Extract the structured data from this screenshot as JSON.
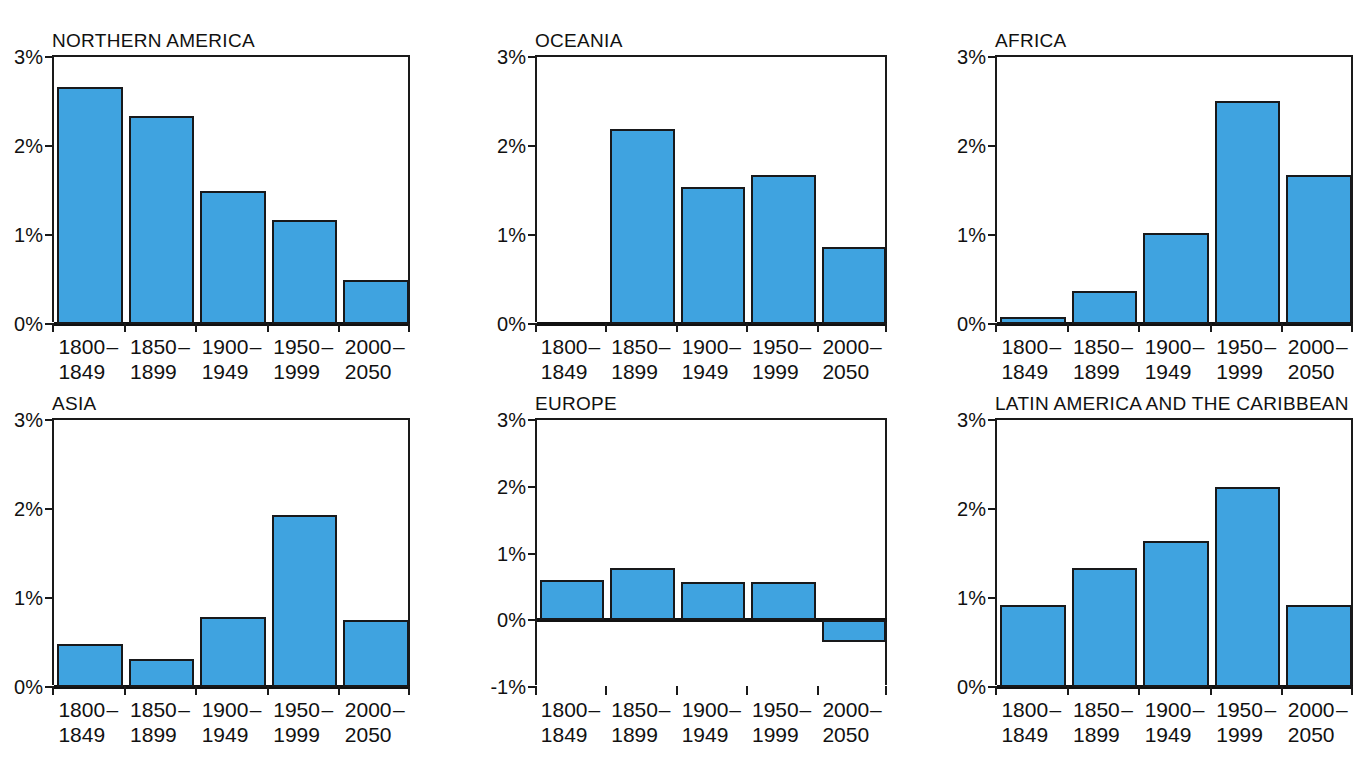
{
  "figure": {
    "clipped_caption": "",
    "bar_color": "#3fa3e0",
    "bar_stroke": "#18191b",
    "axis_color": "#1a1a1a",
    "categories": [
      {
        "line1": "1800",
        "line2": "1849",
        "dash": "–"
      },
      {
        "line1": "1850",
        "line2": "1899",
        "dash": "–"
      },
      {
        "line1": "1900",
        "line2": "1949",
        "dash": "–"
      },
      {
        "line1": "1950",
        "line2": "1999",
        "dash": "–"
      },
      {
        "line1": "2000",
        "line2": "2050",
        "dash": "–"
      }
    ]
  },
  "chart_data": [
    {
      "type": "bar",
      "title": "NORTHERN AMERICA",
      "xlabel": "",
      "ylabel": "",
      "ylim": [
        0,
        3
      ],
      "yticks": [
        0,
        1,
        2,
        3
      ],
      "ytick_labels": [
        "0%",
        "1%",
        "2%",
        "3%"
      ],
      "grid": false,
      "categories": [
        "1800 – 1849",
        "1850 – 1899",
        "1900 – 1949",
        "1950 – 1999",
        "2000 – 2050"
      ],
      "values": [
        2.66,
        2.34,
        1.5,
        1.17,
        0.5
      ]
    },
    {
      "type": "bar",
      "title": "OCEANIA",
      "xlabel": "",
      "ylabel": "",
      "ylim": [
        0,
        3
      ],
      "yticks": [
        0,
        1,
        2,
        3
      ],
      "ytick_labels": [
        "0%",
        "1%",
        "2%",
        "3%"
      ],
      "grid": false,
      "categories": [
        "1800 – 1849",
        "1850 – 1899",
        "1900 – 1949",
        "1950 – 1999",
        "2000 – 2050"
      ],
      "values": [
        0,
        2.19,
        1.54,
        1.67,
        0.86
      ]
    },
    {
      "type": "bar",
      "title": "AFRICA",
      "xlabel": "",
      "ylabel": "",
      "ylim": [
        0,
        3
      ],
      "yticks": [
        0,
        1,
        2,
        3
      ],
      "ytick_labels": [
        "0%",
        "1%",
        "2%",
        "3%"
      ],
      "grid": false,
      "categories": [
        "1800 – 1849",
        "1850 – 1899",
        "1900 – 1949",
        "1950 – 1999",
        "2000 – 2050"
      ],
      "values": [
        0.08,
        0.37,
        1.02,
        2.51,
        1.67
      ]
    },
    {
      "type": "bar",
      "title": "ASIA",
      "xlabel": "",
      "ylabel": "",
      "ylim": [
        0,
        3
      ],
      "yticks": [
        0,
        1,
        2,
        3
      ],
      "ytick_labels": [
        "0%",
        "1%",
        "2%",
        "3%"
      ],
      "grid": false,
      "categories": [
        "1800 – 1849",
        "1850 – 1899",
        "1900 – 1949",
        "1950 – 1999",
        "2000 – 2050"
      ],
      "values": [
        0.48,
        0.31,
        0.79,
        1.93,
        0.75
      ]
    },
    {
      "type": "bar",
      "title": "EUROPE",
      "xlabel": "",
      "ylabel": "",
      "ylim": [
        -1,
        3
      ],
      "yticks": [
        -1,
        0,
        1,
        2,
        3
      ],
      "ytick_labels": [
        "-1%",
        "0%",
        "1%",
        "2%",
        "3%"
      ],
      "grid": false,
      "categories": [
        "1800 – 1849",
        "1850 – 1899",
        "1900 – 1949",
        "1950 – 1999",
        "2000 – 2050"
      ],
      "values": [
        0.6,
        0.78,
        0.58,
        0.57,
        -0.33
      ]
    },
    {
      "type": "bar",
      "title": "LATIN AMERICA AND THE CARIBBEAN",
      "xlabel": "",
      "ylabel": "",
      "ylim": [
        0,
        3
      ],
      "yticks": [
        0,
        1,
        2,
        3
      ],
      "ytick_labels": [
        "0%",
        "1%",
        "2%",
        "3%"
      ],
      "grid": false,
      "categories": [
        "1800 – 1849",
        "1850 – 1899",
        "1900 – 1949",
        "1950 – 1999",
        "2000 – 2050"
      ],
      "values": [
        0.92,
        1.34,
        1.64,
        2.25,
        0.92
      ]
    }
  ]
}
